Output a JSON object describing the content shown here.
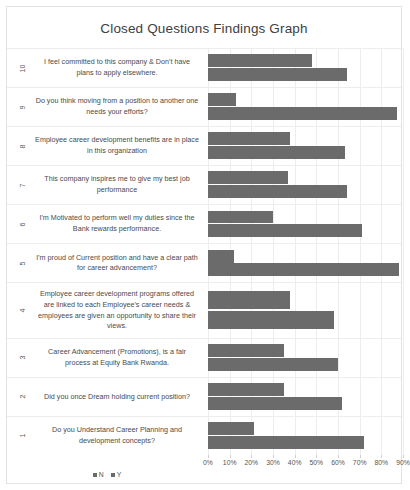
{
  "chart_data": {
    "type": "bar",
    "orientation": "horizontal",
    "title": "Closed Questions Findings Graph",
    "xlabel": "",
    "ylabel": "",
    "xlim": [
      0,
      90
    ],
    "grid": true,
    "legend_position": "bottom-left",
    "tick_labels": [
      "0%",
      "10%",
      "20%",
      "30%",
      "40%",
      "50%",
      "60%",
      "70%",
      "80%",
      "90%"
    ],
    "tick_values": [
      0,
      10,
      20,
      30,
      40,
      50,
      60,
      70,
      80,
      90
    ],
    "series": [
      {
        "name": "N",
        "color": "#6b6b6b",
        "values": [
          21,
          35,
          35,
          38,
          12,
          30,
          37,
          38,
          13,
          48
        ]
      },
      {
        "name": "Y",
        "color": "#6b6b6b",
        "values": [
          72,
          62,
          60,
          58,
          88,
          71,
          64,
          63,
          87,
          64
        ]
      }
    ],
    "categories": [
      {
        "number": "1",
        "label": "Do you Understand Career Planning and development concepts?"
      },
      {
        "number": "2",
        "label": "Did you once Dream holding current position?"
      },
      {
        "number": "3",
        "label": "Career Advancement (Promotions), is a fair process at Equity Bank Rwanda."
      },
      {
        "number": "4",
        "label": "Employee career development programs offered are linked to each Employee's career needs & employees are given an opportunity to share their views."
      },
      {
        "number": "5",
        "label": "I'm proud of Current position and have a clear path for career advancement?"
      },
      {
        "number": "6",
        "label": "I'm Motivated to perform well my duties since the Bank rewards performance."
      },
      {
        "number": "7",
        "label": "This company inspires me to give my best job performance"
      },
      {
        "number": "8",
        "label": "Employee career development benefits are in place in this organization"
      },
      {
        "number": "9",
        "label": "Do you think moving from a position to another one needs your efforts?"
      },
      {
        "number": "10",
        "label": "I feel committed to this company & Don't have plans to apply elsewhere."
      }
    ]
  },
  "legend": {
    "items": [
      {
        "label": "N",
        "color": "#6b6b6b"
      },
      {
        "label": "Y",
        "color": "#6b6b6b"
      }
    ]
  },
  "colors": {
    "bar": "#6b6b6b",
    "grid": "#ededed",
    "frame": "#e2e2e2",
    "text": "#404040"
  }
}
